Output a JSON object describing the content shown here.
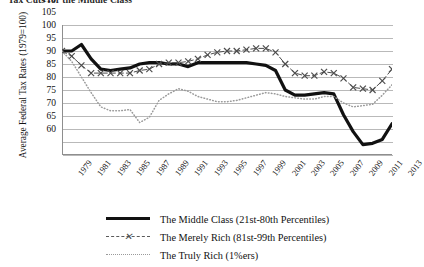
{
  "chart_data": {
    "type": "line",
    "title": "Tax Cuts for the Middle Class",
    "ylabel": "Average Federal Tax Rates (1979=100)",
    "xlabel": "",
    "ylim": [
      60,
      110
    ],
    "yticks": [
      110,
      105,
      100,
      95,
      90,
      85,
      80,
      75,
      70,
      65,
      60
    ],
    "grid": true,
    "legend_position": "bottom",
    "xlim": [
      1979,
      2013
    ],
    "xticks": [
      1979,
      1981,
      1983,
      1985,
      1987,
      1989,
      1991,
      1993,
      1995,
      1997,
      1999,
      2001,
      2003,
      2005,
      2007,
      2009,
      2011,
      2013
    ],
    "x": [
      1979,
      1980,
      1981,
      1982,
      1983,
      1984,
      1985,
      1986,
      1987,
      1988,
      1989,
      1990,
      1991,
      1992,
      1993,
      1994,
      1995,
      1996,
      1997,
      1998,
      1999,
      2000,
      2001,
      2002,
      2003,
      2004,
      2005,
      2006,
      2007,
      2008,
      2009,
      2010,
      2011,
      2012,
      2013
    ],
    "series": [
      {
        "name": "The Middle Class (21st-80th Percentiles)",
        "key": "middle_class",
        "color": "#111111",
        "style": "solid",
        "values": [
          100,
          100,
          102.5,
          97,
          93,
          92.5,
          93,
          93.5,
          95,
          95.5,
          95.5,
          95,
          95,
          94,
          95.5,
          95.5,
          95.5,
          95.5,
          95.5,
          95.5,
          95,
          94.5,
          92.5,
          85,
          83,
          83,
          83.5,
          84,
          83.5,
          75.5,
          69,
          64,
          64.5,
          66,
          72
        ]
      },
      {
        "name": "The Merely Rich (81st-99th Percentiles)",
        "key": "merely_rich",
        "color": "#4d4d4d",
        "style": "dashed-x",
        "values": [
          100,
          98,
          94.5,
          91.5,
          91.5,
          91.5,
          91.5,
          91.5,
          92.5,
          93,
          95,
          95.5,
          95.5,
          96,
          97,
          98.5,
          99.5,
          100,
          100,
          100.5,
          101,
          101,
          99.5,
          95,
          91.5,
          90.5,
          90.5,
          92,
          91.5,
          89.5,
          86,
          85.5,
          85,
          88.5,
          93
        ]
      },
      {
        "name": "The Truly Rich (1%ers)",
        "key": "truly_rich",
        "color": "#9a9a9a",
        "style": "dotted",
        "values": [
          100,
          96,
          90,
          84,
          78.5,
          77,
          77,
          77.5,
          72.5,
          74.5,
          81,
          83.5,
          85.5,
          84.5,
          82.5,
          81.5,
          80.5,
          80.5,
          81,
          82,
          83,
          84,
          83.5,
          82.5,
          82,
          81.5,
          81.5,
          82.5,
          82.5,
          80,
          78.5,
          79,
          79.5,
          83,
          87
        ]
      }
    ]
  },
  "legend": {
    "items": [
      {
        "label": "The Middle Class (21st-80th Percentiles)",
        "key_style": "solid"
      },
      {
        "label": "The Merely Rich (81st-99th Percentiles)",
        "key_style": "dashed-x"
      },
      {
        "label": "The Truly Rich (1%ers)",
        "key_style": "dotted"
      }
    ]
  }
}
